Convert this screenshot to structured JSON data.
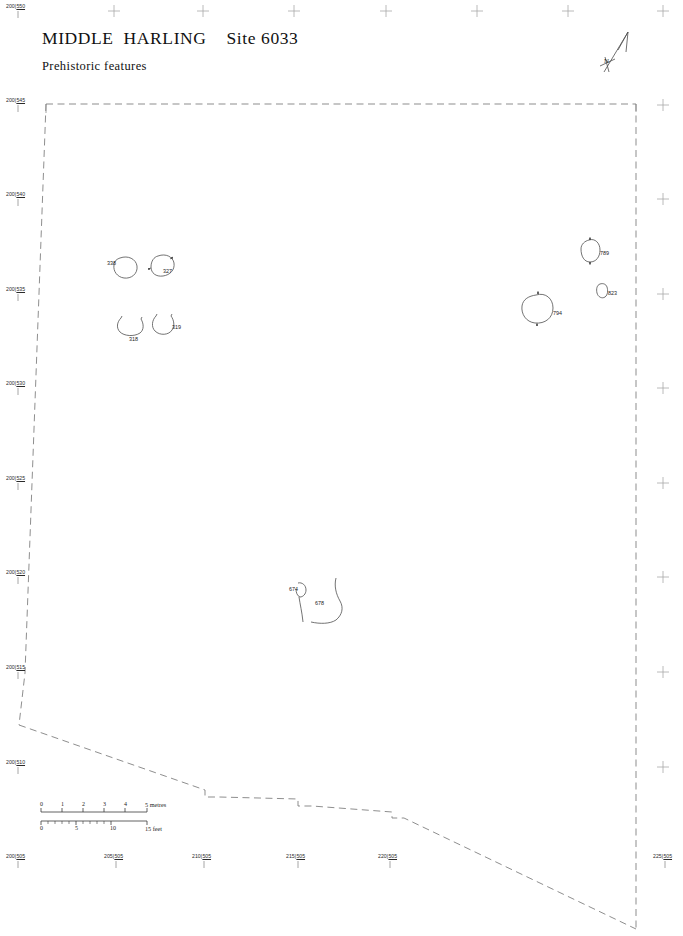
{
  "title": {
    "site_name": "MIDDLE  HARLING",
    "site_number": "Site 6033",
    "subtitle": "Prehistoric features"
  },
  "north_arrow": {
    "label": "N"
  },
  "grid_labels": {
    "left": [
      {
        "easting": "200",
        "northing": "550",
        "x": 6,
        "y": 4,
        "tick_x": 18,
        "tick_y": 11
      },
      {
        "easting": "200",
        "northing": "545",
        "x": 6,
        "y": 98,
        "tick_x": 18,
        "tick_y": 105
      },
      {
        "easting": "200",
        "northing": "540",
        "x": 6,
        "y": 192,
        "tick_x": 18,
        "tick_y": 199
      },
      {
        "easting": "200",
        "northing": "535",
        "x": 6,
        "y": 287,
        "tick_x": 18,
        "tick_y": 294
      },
      {
        "easting": "200",
        "northing": "530",
        "x": 6,
        "y": 381,
        "tick_x": 18,
        "tick_y": 388
      },
      {
        "easting": "200",
        "northing": "525",
        "x": 6,
        "y": 476,
        "tick_x": 18,
        "tick_y": 483
      },
      {
        "easting": "200",
        "northing": "520",
        "x": 6,
        "y": 570,
        "tick_x": 18,
        "tick_y": 577
      },
      {
        "easting": "200",
        "northing": "515",
        "x": 6,
        "y": 665,
        "tick_x": 18,
        "tick_y": 672
      },
      {
        "easting": "200",
        "northing": "510",
        "x": 6,
        "y": 760,
        "tick_x": 18,
        "tick_y": 767
      },
      {
        "easting": "200",
        "northing": "505",
        "x": 6,
        "y": 854,
        "tick_x": 18,
        "tick_y": 861
      }
    ],
    "bottom": [
      {
        "easting": "205",
        "northing": "505",
        "x": 104,
        "y": 854,
        "tick_x": 116,
        "tick_y": 861
      },
      {
        "easting": "210",
        "northing": "505",
        "x": 192,
        "y": 854,
        "tick_x": 204,
        "tick_y": 861
      },
      {
        "easting": "215",
        "northing": "505",
        "x": 286,
        "y": 854,
        "tick_x": 298,
        "tick_y": 861
      },
      {
        "easting": "220",
        "northing": "505",
        "x": 378,
        "y": 854,
        "tick_x": 390,
        "tick_y": 861
      },
      {
        "easting": "225",
        "northing": "505",
        "x": 653,
        "y": 854,
        "tick_x": 665,
        "tick_y": 861
      }
    ],
    "crosses_top": [
      {
        "x": 114,
        "y": 11
      },
      {
        "x": 203,
        "y": 11
      },
      {
        "x": 294,
        "y": 11
      },
      {
        "x": 386,
        "y": 11
      },
      {
        "x": 477,
        "y": 11
      },
      {
        "x": 568,
        "y": 11
      },
      {
        "x": 663,
        "y": 11
      }
    ],
    "crosses_right": [
      {
        "x": 663,
        "y": 105
      },
      {
        "x": 663,
        "y": 199
      },
      {
        "x": 663,
        "y": 294
      },
      {
        "x": 663,
        "y": 388
      },
      {
        "x": 663,
        "y": 483
      },
      {
        "x": 663,
        "y": 577
      },
      {
        "x": 663,
        "y": 672
      },
      {
        "x": 663,
        "y": 767
      }
    ]
  },
  "scale_bar": {
    "metres": {
      "unit_label": "5  metres",
      "ticks": [
        "0",
        "1",
        "2",
        "3",
        "4"
      ]
    },
    "feet": {
      "unit_label": "15  feet",
      "ticks": [
        "0",
        "5",
        "10"
      ]
    }
  },
  "features": [
    {
      "id": "338",
      "label_x": 107,
      "label_y": 261,
      "type": "pit-circular"
    },
    {
      "id": "327",
      "label_x": 163,
      "label_y": 269,
      "type": "pit-circular"
    },
    {
      "id": "318",
      "label_x": 129,
      "label_y": 337,
      "type": "pit-partial"
    },
    {
      "id": "319",
      "label_x": 172,
      "label_y": 325,
      "type": "pit-partial"
    },
    {
      "id": "789",
      "label_x": 600,
      "label_y": 251,
      "type": "pit-circular"
    },
    {
      "id": "823",
      "label_x": 608,
      "label_y": 291,
      "type": "pit-small"
    },
    {
      "id": "794",
      "label_x": 553,
      "label_y": 311,
      "type": "pit-circular"
    },
    {
      "id": "674",
      "label_x": 289,
      "label_y": 587,
      "type": "pit-partial"
    },
    {
      "id": "678",
      "label_x": 315,
      "label_y": 601,
      "type": "linear"
    }
  ],
  "colors": {
    "ink": "#1a1a1a",
    "boundary": "#6e6e6e",
    "feature_outline": "#4a4a4a",
    "grid_mark": "#9a9a9a",
    "background": "#ffffff"
  }
}
